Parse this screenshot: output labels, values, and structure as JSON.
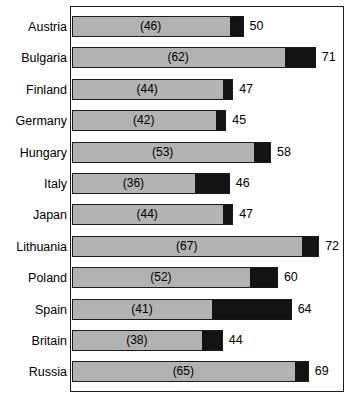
{
  "chart_data": {
    "type": "bar",
    "orientation": "horizontal",
    "stacked": true,
    "title": "",
    "subtitle": "",
    "xlabel": "",
    "ylabel": "",
    "xlim": [
      0,
      79.5
    ],
    "grid": false,
    "legend": null,
    "axis_ticks": [],
    "categories": [
      "Austria",
      "Bulgaria",
      "Finland",
      "Germany",
      "Hungary",
      "Italy",
      "Japan",
      "Lithuania",
      "Poland",
      "Spain",
      "Britain",
      "Russia"
    ],
    "series": [
      {
        "name": "gray-segment",
        "color": "#b2b2b2",
        "values": [
          46,
          62,
          44,
          42,
          53,
          36,
          44,
          67,
          52,
          41,
          38,
          65
        ]
      },
      {
        "name": "black-segment",
        "color": "#131313",
        "values": [
          4,
          9,
          3,
          3,
          5,
          10,
          3,
          5,
          8,
          23,
          6,
          4
        ]
      }
    ],
    "totals": [
      50,
      71,
      47,
      45,
      58,
      46,
      47,
      72,
      60,
      64,
      44,
      69
    ],
    "inner_labels": [
      "(46)",
      "(62)",
      "(44)",
      "(42)",
      "(53)",
      "(36)",
      "(44)",
      "(67)",
      "(52)",
      "(41)",
      "(38)",
      "(65)"
    ],
    "total_labels": [
      "50",
      "71",
      "47",
      "45",
      "58",
      "46",
      "47",
      "72",
      "60",
      "64",
      "44",
      "69"
    ]
  },
  "style": {
    "gray_color": "#b2b2b2",
    "black_color": "#131313",
    "frame_color": "#1a1a1a",
    "background": "#ffffff",
    "text_color": "#000000"
  },
  "geometry": {
    "bar_origin_x": 71.5,
    "px_per_unit": 3.44,
    "row_pitch": 31.4,
    "first_row_top": 16,
    "bar_height": 21
  }
}
